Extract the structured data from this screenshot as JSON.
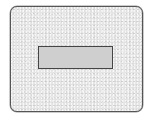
{
  "diagram": {
    "outer_panel": {
      "shape": "rounded-rectangle",
      "fill": "#e6e6e6",
      "texture": "speckled",
      "border_color": "#555555"
    },
    "inner_rect": {
      "shape": "rectangle",
      "fill": "#cfcfcf",
      "border_color": "#444444",
      "label": ""
    }
  }
}
